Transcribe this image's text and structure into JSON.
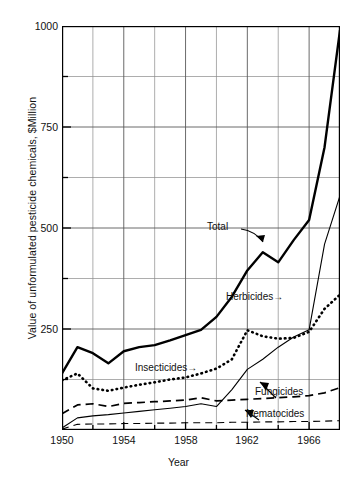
{
  "chart_data": {
    "type": "line",
    "title": "",
    "xlabel": "Year",
    "ylabel": "Value of unformulated pesticide chemicals, $Million",
    "xlim": [
      1950,
      1968
    ],
    "ylim": [
      0,
      1000
    ],
    "grid": true,
    "legend_position": "inline-annotations",
    "xticks": [
      1950,
      1954,
      1958,
      1962,
      1966
    ],
    "xtick_labels": [
      "1950",
      "1954",
      "1958",
      "1962",
      "1966"
    ],
    "x_minor_gridlines": [
      1952,
      1956,
      1960,
      1964,
      1968
    ],
    "yticks": [
      0,
      250,
      500,
      750,
      1000
    ],
    "ytick_labels": [
      "",
      "250",
      "500",
      "750",
      "1000"
    ],
    "y_minor_gridlines": [
      125,
      375,
      625,
      875
    ],
    "x": [
      1950,
      1951,
      1952,
      1953,
      1954,
      1955,
      1956,
      1957,
      1958,
      1959,
      1960,
      1961,
      1962,
      1963,
      1964,
      1965,
      1966,
      1967,
      1968
    ],
    "series": [
      {
        "name": "Total",
        "linestyle": "solid",
        "linewidth": "thick",
        "color": "#000000",
        "values": [
          140,
          205,
          190,
          165,
          195,
          205,
          210,
          222,
          235,
          248,
          280,
          330,
          395,
          440,
          415,
          470,
          520,
          700,
          990
        ]
      },
      {
        "name": "Insecticides",
        "linestyle": "dotted",
        "linewidth": "thick",
        "color": "#000000",
        "values": [
          123,
          140,
          103,
          97,
          105,
          112,
          118,
          125,
          130,
          140,
          152,
          175,
          247,
          232,
          226,
          228,
          243,
          300,
          335
        ]
      },
      {
        "name": "Herbicides",
        "linestyle": "solid",
        "linewidth": "thin",
        "color": "#000000",
        "values": [
          5,
          30,
          35,
          38,
          42,
          46,
          50,
          54,
          58,
          65,
          58,
          100,
          150,
          175,
          205,
          230,
          248,
          460,
          580
        ]
      },
      {
        "name": "Fungicides",
        "linestyle": "dashed",
        "linewidth": "medium",
        "color": "#000000",
        "values": [
          40,
          62,
          65,
          58,
          66,
          68,
          70,
          72,
          74,
          80,
          72,
          74,
          76,
          78,
          80,
          82,
          85,
          92,
          105
        ]
      },
      {
        "name": "Nematocides",
        "linestyle": "dashed",
        "linewidth": "thin",
        "color": "#000000",
        "values": [
          2,
          14,
          15,
          15,
          16,
          16,
          17,
          17,
          18,
          18,
          18,
          19,
          19,
          20,
          20,
          21,
          21,
          22,
          23
        ]
      }
    ],
    "annotations": [
      {
        "text": "Total",
        "pointer": "curved-arrow-down-right"
      },
      {
        "text": "Herbicides→",
        "pointer": "right-arrow"
      },
      {
        "text": "Insecticides→",
        "pointer": "right-arrow"
      },
      {
        "text": "Fungicides",
        "pointer": "leader-line-down-left"
      },
      {
        "text": "Nematocides",
        "pointer": "leader-line-down-left"
      }
    ]
  },
  "axes": {
    "y_title": "Value of unformulated pesticide chemicals, $Million",
    "x_title": "Year",
    "ytick_1000": "1000",
    "ytick_750": "750",
    "ytick_500": "500",
    "ytick_250": "250",
    "xtick_1950": "1950",
    "xtick_1954": "1954",
    "xtick_1958": "1958",
    "xtick_1962": "1962",
    "xtick_1966": "1966"
  },
  "annotations": {
    "total": "Total",
    "herbicides": "Herbicides→",
    "insecticides": "Insecticides→",
    "fungicides": "Fungicides",
    "nematocides": "Nematocides"
  },
  "caption": {
    "text": ""
  }
}
